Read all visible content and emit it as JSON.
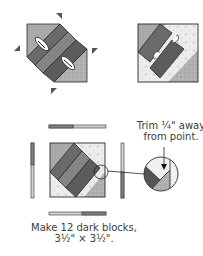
{
  "diagram": {
    "steps": [
      {
        "id": "step-1",
        "description": "Strip set with triangles attached at corners, seams pressed"
      },
      {
        "id": "step-2",
        "description": "Pieced square with pressed seams"
      },
      {
        "id": "step-3",
        "description": "Square with border strips added and trimming detail"
      }
    ],
    "callout": {
      "line1": "Trim ¼\" away",
      "line2": "from point."
    },
    "caption": {
      "line1": "Make 12 dark blocks,",
      "line2": "3½\" × 3½\"."
    },
    "colors": {
      "dark_strip": "#5a5a5a",
      "mid_strip": "#7c7c7c",
      "medium_gray": "#a0a0a0",
      "light_print": "#e2e2e2",
      "outline": "#2a2a2a"
    }
  }
}
